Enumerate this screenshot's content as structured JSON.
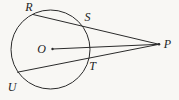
{
  "diagram": {
    "background": "#f8f7f4",
    "stroke_color": "#2b2b2b",
    "circle": {
      "cx": 50.5,
      "cy": 49.5,
      "r": 39.5
    },
    "center_dot": {
      "x": 52.5,
      "y": 49,
      "r": 1.2
    },
    "external_dot": {
      "x": 159,
      "y": 44.3,
      "r": 1.3
    },
    "points": [
      {
        "id": "R",
        "label": "R",
        "x": 33,
        "y": 14.5,
        "label_x": 29,
        "label_y": 6.5,
        "on": "circle"
      },
      {
        "id": "S",
        "label": "S",
        "x": 83.5,
        "y": 26,
        "label_x": 87.5,
        "label_y": 17,
        "on": "circle"
      },
      {
        "id": "O",
        "label": "O",
        "x": 52.5,
        "y": 49,
        "label_x": 41.5,
        "label_y": 48.5,
        "on": "center"
      },
      {
        "id": "T",
        "label": "T",
        "x": 88,
        "y": 57.5,
        "label_x": 92.5,
        "label_y": 66,
        "on": "circle"
      },
      {
        "id": "U",
        "label": "U",
        "x": 17.5,
        "y": 72.2,
        "label_x": 12,
        "label_y": 86.5,
        "on": "circle"
      },
      {
        "id": "P",
        "label": "P",
        "x": 159,
        "y": 44.3,
        "label_x": 167.5,
        "label_y": 43.5,
        "on": "external"
      }
    ],
    "lines": [
      {
        "name": "secant-R-S-P",
        "from": "R",
        "to": "P"
      },
      {
        "name": "segment-O-P",
        "from": "O",
        "to": "P"
      },
      {
        "name": "secant-U-T-P",
        "from": "U",
        "to": "P"
      }
    ]
  }
}
